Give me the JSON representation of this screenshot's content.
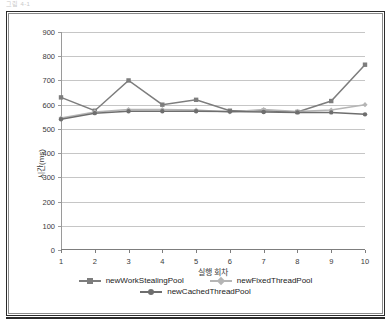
{
  "caption": {
    "text": "그림 4-1"
  },
  "chart_data": {
    "type": "line",
    "title": "",
    "subtitle": "",
    "xlabel": "실행 회차",
    "ylabel": "시간(ms)",
    "x": [
      1,
      2,
      3,
      4,
      5,
      6,
      7,
      8,
      9,
      10
    ],
    "xtick_labels": [
      "1",
      "2",
      "3",
      "4",
      "5",
      "6",
      "7",
      "8",
      "9",
      "10"
    ],
    "ytick_labels": [
      "0",
      "100",
      "200",
      "300",
      "400",
      "500",
      "600",
      "700",
      "800",
      "900"
    ],
    "yticks": [
      0,
      100,
      200,
      300,
      400,
      500,
      600,
      700,
      800,
      900
    ],
    "ylim": [
      0,
      900
    ],
    "xlim": [
      1,
      10
    ],
    "grid": true,
    "legend_position": "bottom",
    "series": [
      {
        "name": "newWorkStealingPool",
        "color": "#7d7d7d",
        "marker": "square",
        "values": [
          630,
          575,
          700,
          600,
          620,
          575,
          575,
          570,
          615,
          765
        ]
      },
      {
        "name": "newFixedThreadPool",
        "color": "#b5b5b5",
        "marker": "diamond",
        "values": [
          545,
          570,
          580,
          580,
          578,
          570,
          580,
          572,
          578,
          600
        ]
      },
      {
        "name": "newCachedThreadPool",
        "color": "#6e6e6e",
        "marker": "circle",
        "values": [
          540,
          565,
          573,
          573,
          573,
          572,
          570,
          568,
          568,
          560
        ]
      }
    ]
  },
  "colors": {
    "frame": "#2b2b2b",
    "grid": "#c6c6c6",
    "axis": "#8a8a8a",
    "text": "#3a3a3a"
  }
}
